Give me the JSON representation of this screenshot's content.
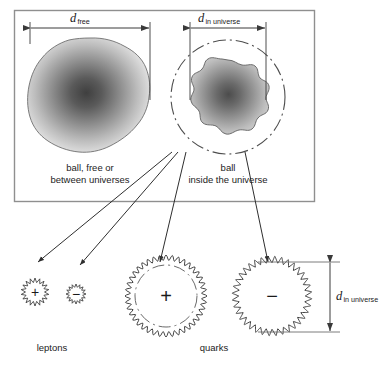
{
  "diagram": {
    "title_present": false,
    "colors": {
      "stroke": "#3a3a3a",
      "box_border": "#8a8a8a",
      "ball_dark": "#4a4a4a",
      "ball_light": "#e8e8e8",
      "background": "#ffffff"
    }
  },
  "box": {
    "name": "comparison-box",
    "x": 14,
    "y": 10,
    "w": 301,
    "h": 192
  },
  "dimensions": {
    "free": {
      "symbol": "d",
      "subscript": "free",
      "orientation": "horizontal",
      "x1": 30,
      "x2": 150,
      "y": 28,
      "label_x": 78,
      "label_y": 10
    },
    "in_universe_top": {
      "symbol": "d",
      "subscript": "in universe",
      "orientation": "horizontal",
      "x1": 190,
      "x2": 266,
      "y": 28,
      "label_x": 200,
      "label_y": 10
    },
    "in_universe_right": {
      "symbol": "d",
      "subscript": "in universe",
      "orientation": "vertical",
      "x": 330,
      "y1": 262,
      "y2": 332,
      "label_x": 337,
      "label_y": 288
    }
  },
  "balls": [
    {
      "name": "ball-free",
      "caption_line1": "ball, free or",
      "caption_line2": "between universes",
      "caption_x": 90,
      "caption_y": 160,
      "cx": 90,
      "cy": 97,
      "r": 59,
      "shape": "bumpy-disc",
      "has_universe_boundary": false
    },
    {
      "name": "ball-in-universe",
      "caption_line1": "ball",
      "caption_line2": "inside the universe",
      "caption_x": 228,
      "caption_y": 160,
      "cx": 228,
      "cy": 97,
      "r": 37,
      "shape": "wavy-disc",
      "has_universe_boundary": true,
      "boundary_r": 57
    }
  ],
  "particles": [
    {
      "name": "lepton-positive",
      "group": "leptons",
      "charge": "+",
      "cx": 35,
      "cy": 292,
      "r": 14,
      "edge": "spiky",
      "teeth": 18,
      "has_inner_boundary": false
    },
    {
      "name": "lepton-negative",
      "group": "leptons",
      "charge": "−",
      "cx": 76,
      "cy": 294,
      "r": 10,
      "edge": "spiky",
      "teeth": 16,
      "has_inner_boundary": false
    },
    {
      "name": "quark-positive",
      "group": "quarks",
      "charge": "+",
      "cx": 166,
      "cy": 296,
      "r": 41,
      "edge": "wavy",
      "teeth": 40,
      "has_inner_boundary": true,
      "inner_r": 31
    },
    {
      "name": "quark-negative",
      "group": "quarks",
      "charge": "−",
      "cx": 272,
      "cy": 296,
      "r": 37,
      "edge": "coiled",
      "teeth": 36,
      "has_inner_boundary": false
    }
  ],
  "group_labels": [
    {
      "name": "leptons-label",
      "text": "leptons",
      "x": 52,
      "y": 343
    },
    {
      "name": "quarks-label",
      "text": "quarks",
      "x": 214,
      "y": 343
    }
  ],
  "arrows": [
    {
      "name": "arrow-to-lepton-positive",
      "x1": 172,
      "y1": 152,
      "x2": 38,
      "y2": 262
    },
    {
      "name": "arrow-to-lepton-negative",
      "x1": 178,
      "y1": 152,
      "x2": 80,
      "y2": 265
    },
    {
      "name": "arrow-to-quark-positive",
      "x1": 186,
      "y1": 152,
      "x2": 160,
      "y2": 262
    },
    {
      "name": "arrow-to-quark-negative",
      "x1": 245,
      "y1": 152,
      "x2": 268,
      "y2": 262
    }
  ]
}
